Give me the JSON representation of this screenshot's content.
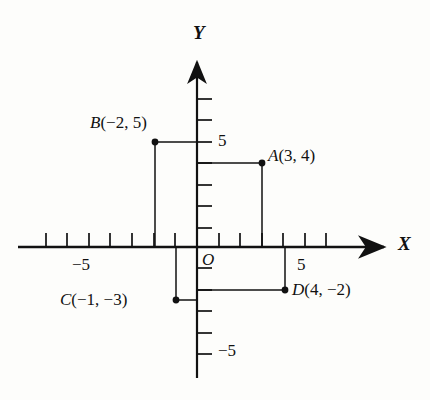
{
  "figure": {
    "kind": "cartesian-coordinate-plane",
    "background_color": "#fdfdfb",
    "ink_color": "#111111",
    "origin_px": {
      "x": 197,
      "y": 247
    },
    "unit_px": 21.5,
    "axes": {
      "x": {
        "label": "X",
        "arrow": "right",
        "line_from_px": {
          "x": 18,
          "y": 247
        },
        "line_to_px": {
          "x": 388,
          "y": 247
        },
        "tick_labels": [
          {
            "text": "−5",
            "value": -5,
            "x_px": 90,
            "y_px": 267
          },
          {
            "text": "5",
            "value": 5,
            "x_px": 300,
            "y_px": 267
          }
        ],
        "tick_values": [
          -7,
          -6,
          -5,
          -4,
          -3,
          -2,
          -1,
          1,
          2,
          3,
          4,
          5,
          6
        ],
        "tick_side": "above"
      },
      "y": {
        "label": "Y",
        "arrow": "up",
        "line_from_px": {
          "x": 197,
          "y": 58
        },
        "line_to_px": {
          "x": 197,
          "y": 378
        },
        "tick_labels": [
          {
            "text": "5",
            "value": 5,
            "x_px": 216,
            "y_px": 142
          },
          {
            "text": "−5",
            "value": -5,
            "x_px": 216,
            "y_px": 352
          }
        ],
        "tick_values": [
          7,
          6,
          5,
          4,
          3,
          2,
          1,
          -1,
          -2,
          -3,
          -4,
          -5,
          -6
        ],
        "tick_side": "right"
      },
      "origin_label": "O"
    },
    "points": [
      {
        "id": "A",
        "label": "A(3, 4)",
        "label_italic_part": "A",
        "label_rest": "(3, 4)",
        "x": 3,
        "y": 4,
        "px": {
          "x": 262,
          "y": 163
        },
        "label_px": {
          "x": 270,
          "y": 155
        },
        "label_anchor": "left",
        "guides": [
          "horizontal-to-y-axis",
          "vertical-to-x-axis"
        ]
      },
      {
        "id": "B",
        "label": "B(−2, 5)",
        "label_italic_part": "B",
        "label_rest": "(−2, 5)",
        "x": -2,
        "y": 5,
        "px": {
          "x": 155,
          "y": 142
        },
        "label_px": {
          "x": 90,
          "y": 113
        },
        "label_anchor": "left",
        "guides": [
          "horizontal-to-y-axis",
          "vertical-to-x-axis"
        ]
      },
      {
        "id": "C",
        "label": "C(−1, −3)",
        "label_italic_part": "C",
        "label_rest": "(−1, −3)",
        "x": -1,
        "y": -3,
        "px": {
          "x": 176,
          "y": 300
        },
        "label_px": {
          "x": 62,
          "y": 292
        },
        "label_anchor": "left",
        "guides": [
          "horizontal-to-y-axis",
          "vertical-to-x-axis"
        ]
      },
      {
        "id": "D",
        "label": "D(4, −2)",
        "label_italic_part": "D",
        "label_rest": "(4, −2)",
        "x": 4,
        "y": -2,
        "px": {
          "x": 285,
          "y": 290
        },
        "label_px": {
          "x": 294,
          "y": 282
        },
        "label_anchor": "left",
        "guides": [
          "horizontal-to-y-axis",
          "vertical-to-x-axis"
        ]
      }
    ]
  }
}
